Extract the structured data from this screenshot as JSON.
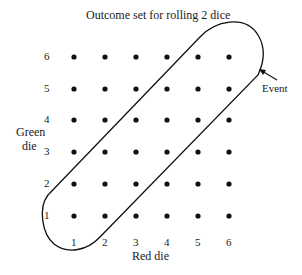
{
  "title": "Outcome set for rolling 2 dice",
  "x_axis": {
    "title": "Red die",
    "ticks": [
      "1",
      "2",
      "3",
      "4",
      "5",
      "6"
    ]
  },
  "y_axis": {
    "title_line1": "Green",
    "title_line2": "die",
    "ticks": [
      "1",
      "2",
      "3",
      "4",
      "5",
      "6"
    ]
  },
  "event_label": "Event",
  "grid": {
    "rows": 6,
    "cols": 6,
    "dot_color": "#111111"
  },
  "event_outcomes": [
    [
      1,
      1
    ],
    [
      1,
      2
    ],
    [
      2,
      1
    ],
    [
      2,
      2
    ],
    [
      2,
      3
    ],
    [
      3,
      2
    ],
    [
      3,
      3
    ],
    [
      3,
      4
    ],
    [
      4,
      3
    ],
    [
      4,
      4
    ],
    [
      4,
      5
    ],
    [
      5,
      4
    ],
    [
      5,
      5
    ],
    [
      5,
      6
    ],
    [
      6,
      5
    ],
    [
      6,
      6
    ]
  ]
}
